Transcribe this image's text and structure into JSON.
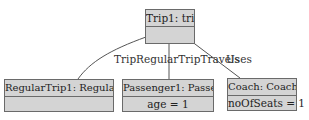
{
  "objects": {
    "trip": {
      "title": "Trip1: trip",
      "attributes": ""
    },
    "regular_trip": {
      "title": "RegularTrip1: RegularTrip",
      "attributes": ""
    },
    "passenger": {
      "title": "Passenger1: Passenger",
      "attributes": "age = 1"
    },
    "coach": {
      "title": "Coach: Coach",
      "attributes": "noOfSeats = 1"
    }
  },
  "links": {
    "travels": {
      "label": "TripRegularTripTravels"
    },
    "uses": {
      "label": "Uses"
    }
  }
}
